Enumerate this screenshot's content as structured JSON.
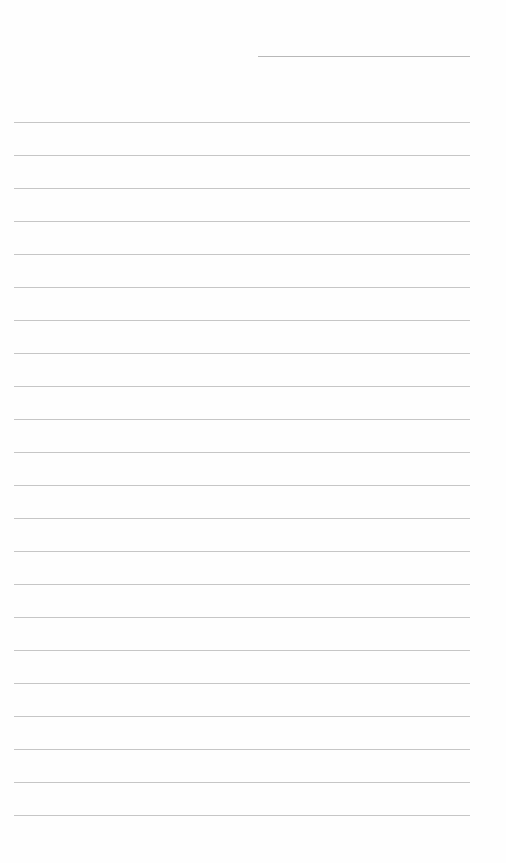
{
  "document": {
    "type": "lined-paper",
    "header_line": {
      "left": 258,
      "top": 56,
      "width": 212,
      "color": "#b8b8b8"
    },
    "rules": {
      "count": 22,
      "first_top": 122,
      "spacing": 33,
      "left": 14,
      "width": 456,
      "color": "#c6c6c6"
    },
    "background_color": "#fefefe"
  }
}
